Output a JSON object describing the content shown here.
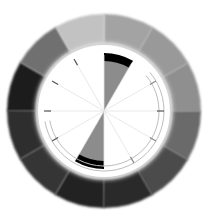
{
  "diagram": {
    "type": "color-wheel-grayscale",
    "center": [
      104,
      111
    ],
    "outer_ring": {
      "outer_radius": 97,
      "inner_radius": 70,
      "segment_count": 12,
      "start_angle_deg": -90,
      "segments": [
        {
          "index": 0,
          "from_deg": -90,
          "to_deg": -60,
          "color": "#a3a3a3"
        },
        {
          "index": 1,
          "from_deg": -60,
          "to_deg": -30,
          "color": "#999999"
        },
        {
          "index": 2,
          "from_deg": -30,
          "to_deg": 0,
          "color": "#8f8f8f"
        },
        {
          "index": 3,
          "from_deg": 0,
          "to_deg": 30,
          "color": "#6b6b6b"
        },
        {
          "index": 4,
          "from_deg": 30,
          "to_deg": 60,
          "color": "#4c4c4c"
        },
        {
          "index": 5,
          "from_deg": 60,
          "to_deg": 90,
          "color": "#2b2b2b"
        },
        {
          "index": 6,
          "from_deg": 90,
          "to_deg": 120,
          "color": "#242424"
        },
        {
          "index": 7,
          "from_deg": 120,
          "to_deg": 150,
          "color": "#363636"
        },
        {
          "index": 8,
          "from_deg": 150,
          "to_deg": 180,
          "color": "#2e2e2e"
        },
        {
          "index": 9,
          "from_deg": 180,
          "to_deg": 210,
          "color": "#1a1a1a"
        },
        {
          "index": 10,
          "from_deg": 210,
          "to_deg": 240,
          "color": "#707070"
        },
        {
          "index": 11,
          "from_deg": 240,
          "to_deg": 270,
          "color": "#c2c2c2"
        }
      ]
    },
    "inner_disk": {
      "radius": 66,
      "color": "#ffffff",
      "spoke_count": 12,
      "spoke_color": "#e2e2e2",
      "highlighted_wedges": [
        {
          "from_deg": -90,
          "to_deg": -60,
          "fill": "#8c8c8c",
          "arc_color": "#000000"
        },
        {
          "from_deg": 90,
          "to_deg": 120,
          "fill": "#8c8c8c",
          "arc_color": "#000000"
        }
      ],
      "tick_marks": [
        {
          "angle_deg": -120,
          "color": "#555555"
        },
        {
          "angle_deg": -150,
          "color": "#555555"
        },
        {
          "angle_deg": 180,
          "color": "#555555"
        },
        {
          "angle_deg": 150,
          "color": "#555555"
        },
        {
          "angle_deg": -30,
          "color": "#888888"
        },
        {
          "angle_deg": 0,
          "color": "#555555"
        },
        {
          "angle_deg": 30,
          "color": "#888888"
        },
        {
          "angle_deg": 60,
          "color": "#888888"
        }
      ],
      "guide_rings": [
        {
          "radius": 60,
          "from_deg": -40,
          "to_deg": 170
        },
        {
          "radius": 55,
          "from_deg": -40,
          "to_deg": 170
        }
      ]
    }
  }
}
